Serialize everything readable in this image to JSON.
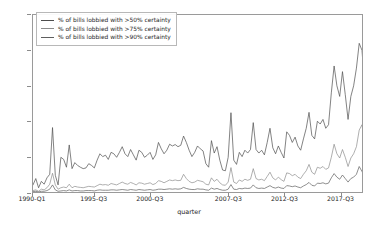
{
  "chart_data": {
    "type": "line",
    "title": "",
    "xlabel": "quarter",
    "ylabel": "",
    "grid": false,
    "legend_position": "upper-left",
    "ylim": [
      0.0,
      0.5
    ],
    "yticks": [
      "0.0",
      "0.1",
      "0.2",
      "0.3",
      "0.4",
      "0.5"
    ],
    "ytick_values": [
      0.0,
      0.1,
      0.2,
      0.3,
      0.4,
      0.5
    ],
    "xticks": [
      "1990-Q1",
      "1995-Q3",
      "2000-Q3",
      "2007-Q3",
      "2012-Q3",
      "2017-Q3"
    ],
    "xtick_indices": [
      0,
      22,
      42,
      70,
      90,
      110
    ],
    "x_count": 119,
    "series": [
      {
        "name": "% of bills lobbied with >50% certainty",
        "color": "#4d4d4d",
        "values": [
          0.02,
          0.038,
          0.012,
          0.03,
          0.022,
          0.04,
          0.05,
          0.182,
          0.047,
          0.02,
          0.098,
          0.092,
          0.07,
          0.133,
          0.066,
          0.083,
          0.075,
          0.07,
          0.066,
          0.068,
          0.08,
          0.075,
          0.068,
          0.09,
          0.108,
          0.1,
          0.104,
          0.092,
          0.112,
          0.108,
          0.098,
          0.112,
          0.128,
          0.108,
          0.1,
          0.12,
          0.105,
          0.09,
          0.118,
          0.112,
          0.098,
          0.104,
          0.112,
          0.092,
          0.105,
          0.14,
          0.122,
          0.108,
          0.118,
          0.135,
          0.13,
          0.134,
          0.128,
          0.132,
          0.158,
          0.14,
          0.118,
          0.1,
          0.112,
          0.13,
          0.122,
          0.116,
          0.08,
          0.07,
          0.145,
          0.11,
          0.128,
          0.09,
          0.062,
          0.06,
          0.098,
          0.224,
          0.09,
          0.078,
          0.112,
          0.1,
          0.118,
          0.11,
          0.12,
          0.196,
          0.12,
          0.11,
          0.118,
          0.105,
          0.14,
          0.18,
          0.125,
          0.108,
          0.13,
          0.112,
          0.096,
          0.17,
          0.16,
          0.14,
          0.155,
          0.13,
          0.118,
          0.15,
          0.18,
          0.225,
          0.16,
          0.15,
          0.2,
          0.192,
          0.205,
          0.18,
          0.19,
          0.28,
          0.356,
          0.3,
          0.27,
          0.34,
          0.275,
          0.205,
          0.27,
          0.3,
          0.35,
          0.42,
          0.4,
          0.29,
          0.27,
          0.42,
          0.48,
          0.465,
          0.49,
          0.485
        ]
      },
      {
        "name": "% of bills lobbied with >75% certainty",
        "color": "#8c8c8c",
        "values": [
          0.004,
          0.006,
          0.002,
          0.008,
          0.006,
          0.012,
          0.022,
          0.053,
          0.02,
          0.008,
          0.012,
          0.014,
          0.012,
          0.022,
          0.012,
          0.016,
          0.014,
          0.013,
          0.012,
          0.014,
          0.016,
          0.015,
          0.014,
          0.018,
          0.022,
          0.02,
          0.021,
          0.019,
          0.024,
          0.022,
          0.02,
          0.024,
          0.028,
          0.024,
          0.022,
          0.027,
          0.024,
          0.02,
          0.026,
          0.025,
          0.022,
          0.024,
          0.026,
          0.021,
          0.024,
          0.032,
          0.03,
          0.026,
          0.03,
          0.034,
          0.032,
          0.034,
          0.032,
          0.033,
          0.05,
          0.038,
          0.03,
          0.026,
          0.028,
          0.033,
          0.031,
          0.029,
          0.022,
          0.02,
          0.04,
          0.03,
          0.036,
          0.026,
          0.02,
          0.019,
          0.028,
          0.069,
          0.028,
          0.024,
          0.034,
          0.03,
          0.036,
          0.033,
          0.036,
          0.066,
          0.038,
          0.034,
          0.036,
          0.032,
          0.044,
          0.056,
          0.04,
          0.034,
          0.042,
          0.035,
          0.03,
          0.054,
          0.052,
          0.046,
          0.05,
          0.042,
          0.038,
          0.05,
          0.06,
          0.078,
          0.056,
          0.05,
          0.07,
          0.067,
          0.072,
          0.064,
          0.068,
          0.098,
          0.135,
          0.108,
          0.096,
          0.12,
          0.098,
          0.072,
          0.096,
          0.108,
          0.128,
          0.175,
          0.19,
          0.13,
          0.12,
          0.195,
          0.215,
          0.205,
          0.26,
          0.238
        ]
      },
      {
        "name": "% of bills lobbied with >90% certainty",
        "color": "#5e5e5e",
        "values": [
          0.001,
          0.002,
          0.0,
          0.002,
          0.002,
          0.004,
          0.008,
          0.02,
          0.006,
          0.002,
          0.003,
          0.004,
          0.003,
          0.006,
          0.003,
          0.004,
          0.004,
          0.003,
          0.003,
          0.004,
          0.004,
          0.004,
          0.003,
          0.005,
          0.006,
          0.005,
          0.005,
          0.005,
          0.006,
          0.006,
          0.005,
          0.006,
          0.007,
          0.006,
          0.005,
          0.007,
          0.006,
          0.005,
          0.007,
          0.006,
          0.005,
          0.006,
          0.007,
          0.005,
          0.006,
          0.008,
          0.008,
          0.007,
          0.008,
          0.009,
          0.008,
          0.009,
          0.008,
          0.009,
          0.013,
          0.01,
          0.008,
          0.007,
          0.007,
          0.009,
          0.008,
          0.008,
          0.006,
          0.005,
          0.011,
          0.008,
          0.01,
          0.007,
          0.005,
          0.005,
          0.008,
          0.021,
          0.008,
          0.007,
          0.01,
          0.009,
          0.011,
          0.01,
          0.011,
          0.02,
          0.012,
          0.01,
          0.011,
          0.01,
          0.014,
          0.018,
          0.013,
          0.011,
          0.014,
          0.011,
          0.01,
          0.018,
          0.017,
          0.015,
          0.017,
          0.014,
          0.012,
          0.017,
          0.021,
          0.027,
          0.019,
          0.017,
          0.025,
          0.024,
          0.026,
          0.023,
          0.025,
          0.04,
          0.052,
          0.042,
          0.036,
          0.048,
          0.038,
          0.028,
          0.038,
          0.042,
          0.05,
          0.072,
          0.058,
          0.04,
          0.036,
          0.062,
          0.08,
          0.072,
          0.092,
          0.084
        ]
      }
    ]
  }
}
